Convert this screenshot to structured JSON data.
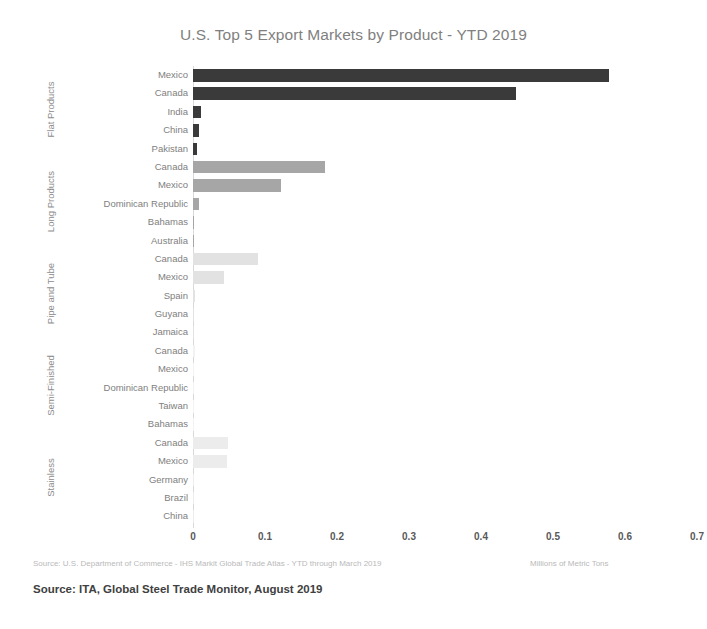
{
  "chart_data": {
    "type": "bar",
    "orientation": "horizontal",
    "title": "U.S. Top 5 Export Markets by Product - YTD 2019",
    "xlabel": "Millions of Metric Tons",
    "ylabel": "",
    "xlim": [
      0,
      0.7
    ],
    "xticks": [
      "0",
      "0.1",
      "0.2",
      "0.3",
      "0.4",
      "0.5",
      "0.6",
      "0.7"
    ],
    "grid": false,
    "legend": "none",
    "groups": [
      {
        "name": "Flat Products",
        "color": "#3a3a3a",
        "categories": [
          "Mexico",
          "Canada",
          "India",
          "China",
          "Pakistan"
        ],
        "values": [
          0.578,
          0.448,
          0.011,
          0.008,
          0.006
        ]
      },
      {
        "name": "Long Products",
        "color": "#a6a6a6",
        "categories": [
          "Canada",
          "Mexico",
          "Dominican Republic",
          "Bahamas",
          "Australia"
        ],
        "values": [
          0.183,
          0.122,
          0.009,
          0.002,
          0.001
        ]
      },
      {
        "name": "Pipe and Tube",
        "color": "#e2e2e2",
        "categories": [
          "Canada",
          "Mexico",
          "Spain",
          "Guyana",
          "Jamaica"
        ],
        "values": [
          0.09,
          0.043,
          0.003,
          0.002,
          0.001
        ]
      },
      {
        "name": "Semi-Finished",
        "color": "#f2f2f2",
        "categories": [
          "Canada",
          "Mexico",
          "Dominican Republic",
          "Taiwan",
          "Bahamas"
        ],
        "values": [
          0.003,
          0.002,
          0.001,
          0.001,
          0.001
        ]
      },
      {
        "name": "Stainless",
        "color": "#ececec",
        "categories": [
          "Canada",
          "Mexico",
          "Germany",
          "Brazil",
          "China"
        ],
        "values": [
          0.049,
          0.047,
          0.002,
          0.001,
          0.001
        ]
      }
    ]
  },
  "footer": {
    "source_note": "Source: U.S. Department of Commerce - IHS Markit Global Trade Atlas - YTD through March 2019",
    "units_note": "Millions of Metric Tons",
    "source_bold": "Source: ITA, Global Steel Trade Monitor, August 2019"
  }
}
